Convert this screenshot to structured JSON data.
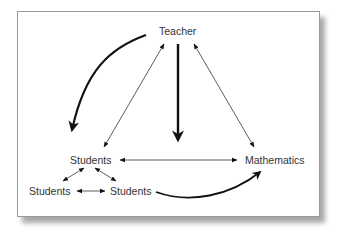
{
  "diagram": {
    "nodes": {
      "teacher": "Teacher",
      "students_main": "Students",
      "mathematics": "Mathematics",
      "students_left": "Students",
      "students_right": "Students"
    },
    "edges": [
      {
        "from": "Teacher",
        "to": "Students",
        "style": "thick curved arrow"
      },
      {
        "from": "Teacher",
        "to": "(center)",
        "style": "thick straight arrow"
      },
      {
        "from": "Teacher",
        "to": "Students",
        "style": "thin double arrow"
      },
      {
        "from": "Teacher",
        "to": "Mathematics",
        "style": "thin double arrow"
      },
      {
        "from": "Students",
        "to": "Mathematics",
        "style": "thin double arrow"
      },
      {
        "from": "Students",
        "to": "Students (left)",
        "style": "thin double arrow"
      },
      {
        "from": "Students",
        "to": "Students (right)",
        "style": "thin double arrow"
      },
      {
        "from": "Students (left)",
        "to": "Students (right)",
        "style": "thin double arrow"
      },
      {
        "from": "Students (right)",
        "to": "Mathematics",
        "style": "thick curved arrow"
      }
    ],
    "colors": {
      "line": "#111111",
      "text": "#333333",
      "border": "#9a9a9a"
    }
  }
}
